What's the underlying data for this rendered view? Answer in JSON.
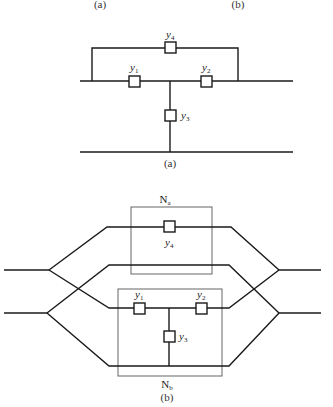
{
  "header": {
    "caption_left": "(a)",
    "caption_right": "(b)"
  },
  "diagram_a": {
    "caption": "(a)",
    "elements": [
      {
        "id": "y4",
        "label": "y",
        "sub": "4"
      },
      {
        "id": "y1",
        "label": "y",
        "sub": "1"
      },
      {
        "id": "y2",
        "label": "y",
        "sub": "2"
      },
      {
        "id": "y3",
        "label": "y",
        "sub": "3"
      }
    ]
  },
  "diagram_b": {
    "caption": "(b)",
    "subnetwork_a": {
      "label": "N",
      "sub": "a"
    },
    "subnetwork_b": {
      "label": "N",
      "sub": "b"
    },
    "elements": [
      {
        "id": "y4",
        "label": "y",
        "sub": "4"
      },
      {
        "id": "y1",
        "label": "y",
        "sub": "1"
      },
      {
        "id": "y2",
        "label": "y",
        "sub": "2"
      },
      {
        "id": "y3",
        "label": "y",
        "sub": "3"
      }
    ]
  }
}
